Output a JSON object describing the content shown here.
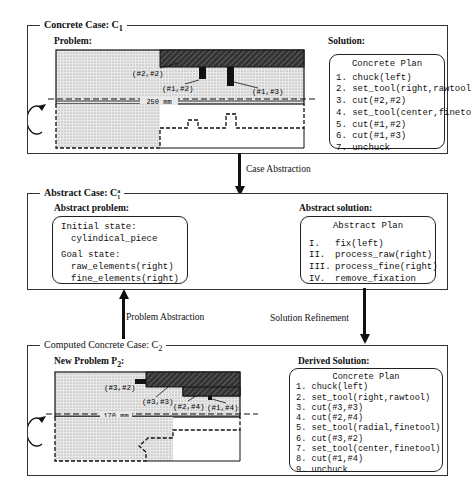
{
  "concrete_case": {
    "title": "Concrete Case: C",
    "title_sub": "1",
    "problem_label": "Problem:",
    "solution_label": "Solution:",
    "diagram": {
      "dimension": "250 mm",
      "callouts": [
        "(#2,#2)",
        "(#1,#2)",
        "(#1,#3)"
      ]
    },
    "plan": {
      "title": "Concrete Plan",
      "steps": [
        {
          "num": "1.",
          "text": "chuck(left)"
        },
        {
          "num": "2.",
          "text": "set_tool(right,rawtool)"
        },
        {
          "num": "3.",
          "text": "cut(#2,#2)"
        },
        {
          "num": "4.",
          "text": "set_tool(center,finetool)"
        },
        {
          "num": "5.",
          "text": "cut(#1,#2)"
        },
        {
          "num": "6.",
          "text": "cut(#1,#3)"
        },
        {
          "num": "7.",
          "text": "unchuck"
        }
      ]
    }
  },
  "arrows": {
    "case_abstraction": "Case Abstraction",
    "problem_abstraction": "Problem Abstraction",
    "solution_refinement": "Solution Refinement"
  },
  "abstract_case": {
    "title": "Abstract Case: C",
    "title_sup": "a",
    "title_sub": "1",
    "problem_label": "Abstract problem:",
    "solution_label": "Abstract solution:",
    "problem": {
      "initial_label": "Initial state:",
      "initial_value": "cylindical_piece",
      "goal_label": "Goal state:",
      "goal_values": [
        "raw_elements(right)",
        "fine_elements(right)"
      ]
    },
    "plan": {
      "title": "Abstract Plan",
      "steps": [
        {
          "num": "I.",
          "text": "fix(left)"
        },
        {
          "num": "II.",
          "text": "process_raw(right)"
        },
        {
          "num": "III.",
          "text": "process_fine(right)"
        },
        {
          "num": "IV.",
          "text": "remove_fixation"
        }
      ]
    }
  },
  "computed_case": {
    "title": "Computed Concrete Case: C",
    "title_sub": "2",
    "problem_label": "New Problem P",
    "problem_sub": "2",
    "problem_suffix": ":",
    "solution_label": "Derived Solution:",
    "diagram": {
      "dimension": "170 mm",
      "callouts": [
        "(#3,#2)",
        "(#3,#3)",
        "(#2,#4)",
        "(#1,#4)"
      ]
    },
    "plan": {
      "title": "Concrete Plan",
      "steps": [
        {
          "num": "1.",
          "text": "chuck(left)"
        },
        {
          "num": "2.",
          "text": "set_tool(right,rawtool)"
        },
        {
          "num": "3.",
          "text": "cut(#3,#3)"
        },
        {
          "num": "4.",
          "text": "cut(#2,#4)"
        },
        {
          "num": "5.",
          "text": "set_tool(radial,finetool)"
        },
        {
          "num": "6.",
          "text": "cut(#3,#2)"
        },
        {
          "num": "7.",
          "text": "set_tool(center,finetool)"
        },
        {
          "num": "8.",
          "text": "cut(#1,#4)"
        },
        {
          "num": "9.",
          "text": "unchuck"
        }
      ]
    }
  }
}
